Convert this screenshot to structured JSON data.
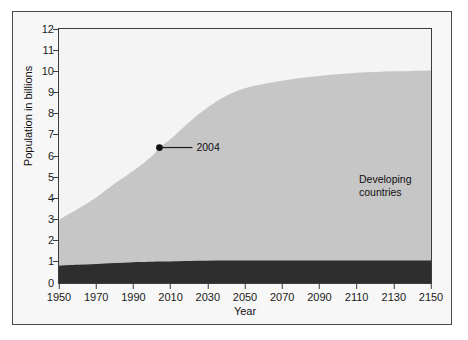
{
  "chart_data": {
    "type": "area",
    "title": "",
    "subtitle": "",
    "xlabel": "Year",
    "ylabel": "Population in billions",
    "xlim": [
      1950,
      2150
    ],
    "ylim": [
      0,
      12
    ],
    "stacked": true,
    "grid": false,
    "legend_position": "in-plot-labels",
    "xticks": [
      1950,
      1970,
      1990,
      2010,
      2030,
      2050,
      2070,
      2090,
      2110,
      2130,
      2150
    ],
    "yticks": [
      0,
      1,
      2,
      3,
      4,
      5,
      6,
      7,
      8,
      9,
      10,
      11,
      12
    ],
    "x": [
      1950,
      1960,
      1970,
      1980,
      1990,
      2000,
      2004,
      2010,
      2020,
      2030,
      2040,
      2050,
      2060,
      2070,
      2080,
      2090,
      2100,
      2110,
      2120,
      2130,
      2140,
      2150
    ],
    "series": [
      {
        "name": "Developed countries",
        "color": "#2e2e2e",
        "values": [
          0.82,
          0.86,
          0.9,
          0.94,
          0.98,
          1.0,
          1.01,
          1.02,
          1.04,
          1.05,
          1.06,
          1.06,
          1.06,
          1.06,
          1.06,
          1.06,
          1.06,
          1.06,
          1.06,
          1.06,
          1.06,
          1.06
        ]
      },
      {
        "name": "Developing countries",
        "color": "#c6c6c6",
        "values": [
          2.17,
          2.64,
          3.14,
          3.76,
          4.32,
          5.0,
          5.39,
          5.78,
          6.56,
          7.25,
          7.79,
          8.14,
          8.34,
          8.5,
          8.62,
          8.72,
          8.8,
          8.87,
          8.91,
          8.94,
          8.96,
          8.98
        ]
      }
    ],
    "totals": [
      2.99,
      3.5,
      4.04,
      4.7,
      5.3,
      6.0,
      6.4,
      6.8,
      7.6,
      8.3,
      8.85,
      9.2,
      9.4,
      9.56,
      9.68,
      9.78,
      9.86,
      9.93,
      9.97,
      10.0,
      10.02,
      10.04
    ],
    "annotations": [
      {
        "label": "2004",
        "x": 2004,
        "y": 6.4,
        "marker": "filled-circle",
        "leader_line": true
      }
    ],
    "series_labels": [
      {
        "text": "Developing\ncountries",
        "color": "#111111"
      },
      {
        "text": "Developed countries",
        "color": "#ffffff"
      }
    ]
  },
  "axis": {
    "y_title": "Population in billions",
    "x_title": "Year",
    "y_ticks": [
      "12",
      "11",
      "10",
      "9",
      "8",
      "7",
      "6",
      "5",
      "4",
      "3",
      "2",
      "1",
      "0"
    ],
    "x_ticks": [
      "1950",
      "1970",
      "1990",
      "2010",
      "2030",
      "2050",
      "2070",
      "2090",
      "2110",
      "2130",
      "2150"
    ]
  },
  "labels": {
    "developing": "Developing\ncountries",
    "developed": "Developed countries",
    "annotation_2004": "2004"
  },
  "colors": {
    "developing_fill": "#c6c6c6",
    "developed_fill": "#2e2e2e",
    "plot_background": "#f4f4f4",
    "figure_background": "#f7f7f7",
    "axis_line": "#3c3c3c",
    "text": "#111111"
  }
}
